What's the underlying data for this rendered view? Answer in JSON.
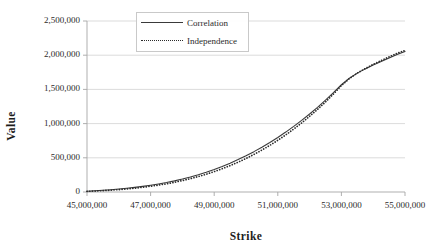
{
  "chart_data": {
    "type": "line",
    "title": "",
    "xlabel": "Strike",
    "ylabel": "Value",
    "xlim": [
      45000000,
      55000000
    ],
    "ylim": [
      0,
      2500000
    ],
    "grid": true,
    "legend_position": "top-center-left",
    "xticks": [
      45000000,
      47000000,
      49000000,
      51000000,
      53000000,
      55000000
    ],
    "xtick_labels": [
      "45,000,000",
      "47,000,000",
      "49,000,000",
      "51,000,000",
      "53,000,000",
      "55,000,000"
    ],
    "yticks": [
      0,
      500000,
      1000000,
      1500000,
      2000000,
      2500000
    ],
    "ytick_labels": [
      "0",
      "500,000",
      "1,000,000",
      "1,500,000",
      "2,000,000",
      "2,500,000"
    ],
    "x": [
      45000000,
      45250000,
      45500000,
      45750000,
      46000000,
      46250000,
      46500000,
      46750000,
      47000000,
      47250000,
      47500000,
      47750000,
      48000000,
      48250000,
      48500000,
      48750000,
      49000000,
      49250000,
      49500000,
      49750000,
      50000000,
      50250000,
      50500000,
      50750000,
      51000000,
      51250000,
      51500000,
      51750000,
      52000000,
      52250000,
      52500000,
      52750000,
      53000000,
      53250000,
      53500000,
      53750000,
      54000000,
      54250000,
      54500000,
      54750000,
      55000000
    ],
    "series": [
      {
        "name": "Correlation",
        "style": "solid",
        "color": "#3a3a3a",
        "values": [
          12000,
          18000,
          25000,
          33000,
          43000,
          54000,
          67000,
          82000,
          99000,
          118000,
          139000,
          163000,
          190000,
          220000,
          253000,
          290000,
          330000,
          374000,
          422000,
          474000,
          530000,
          590000,
          655000,
          724000,
          798000,
          876000,
          959000,
          1047000,
          1140000,
          1238000,
          1342000,
          1452000,
          1568000,
          1664000,
          1738000,
          1800000,
          1856000,
          1908000,
          1958000,
          2010000,
          2055000
        ]
      },
      {
        "name": "Independence",
        "style": "dotted",
        "color": "#2b2b2b",
        "values": [
          9000,
          14000,
          20000,
          27000,
          35000,
          45000,
          56000,
          69000,
          84000,
          101000,
          120000,
          142000,
          167000,
          195000,
          226000,
          260000,
          298000,
          340000,
          386000,
          436000,
          490000,
          549000,
          613000,
          682000,
          756000,
          835000,
          920000,
          1010000,
          1106000,
          1208000,
          1316000,
          1432000,
          1556000,
          1658000,
          1738000,
          1805000,
          1866000,
          1922000,
          1976000,
          2028000,
          2070000
        ]
      }
    ]
  }
}
